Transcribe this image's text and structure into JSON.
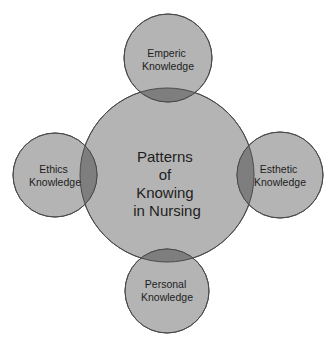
{
  "diagram": {
    "title": "Patterns of Knowing in Nursing",
    "colors": {
      "background": "#ffffff",
      "circle_fill": "#b4b4b4",
      "overlap_fill": "#7e7e7e",
      "stroke": "#4a4a4a",
      "text": "#1e1e1e"
    },
    "center": {
      "lines": [
        "Patterns",
        "of",
        "Knowing",
        "in Nursing"
      ],
      "cx": 167,
      "cy": 175,
      "r": 87
    },
    "satellites": [
      {
        "id": "emperic",
        "lines": [
          "Emperic",
          "Knowledge"
        ],
        "cx": 168,
        "cy": 58,
        "r": 44
      },
      {
        "id": "ethics",
        "lines": [
          "Ethics",
          "Knowledge"
        ],
        "cx": 55,
        "cy": 175,
        "r": 42
      },
      {
        "id": "esthetic",
        "lines": [
          "Esthetic",
          "Knowledge"
        ],
        "cx": 280,
        "cy": 175,
        "r": 43
      },
      {
        "id": "personal",
        "lines": [
          "Personal",
          "Knowledge"
        ],
        "cx": 167,
        "cy": 291,
        "r": 42
      }
    ]
  }
}
